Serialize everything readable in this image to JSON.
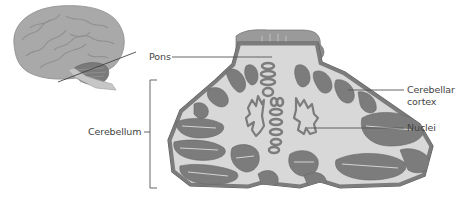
{
  "diagram": {
    "title": "",
    "labels": {
      "pons": "Pons",
      "cerebellar_cortex_line1": "Cerebellar",
      "cerebellar_cortex_line2": "cortex",
      "nuclei": "Nuclei",
      "cerebellum": "Cerebellum"
    },
    "colors": {
      "white_matter": "#d8d8d8",
      "gray_matter": "#7c7c7c",
      "outline": "#5a5a5a",
      "brain": "#a9a9a9",
      "leader_line": "#555555",
      "text": "#444444"
    },
    "panels": [
      "lateral-brain-inset",
      "cerebellum-cross-section"
    ]
  }
}
